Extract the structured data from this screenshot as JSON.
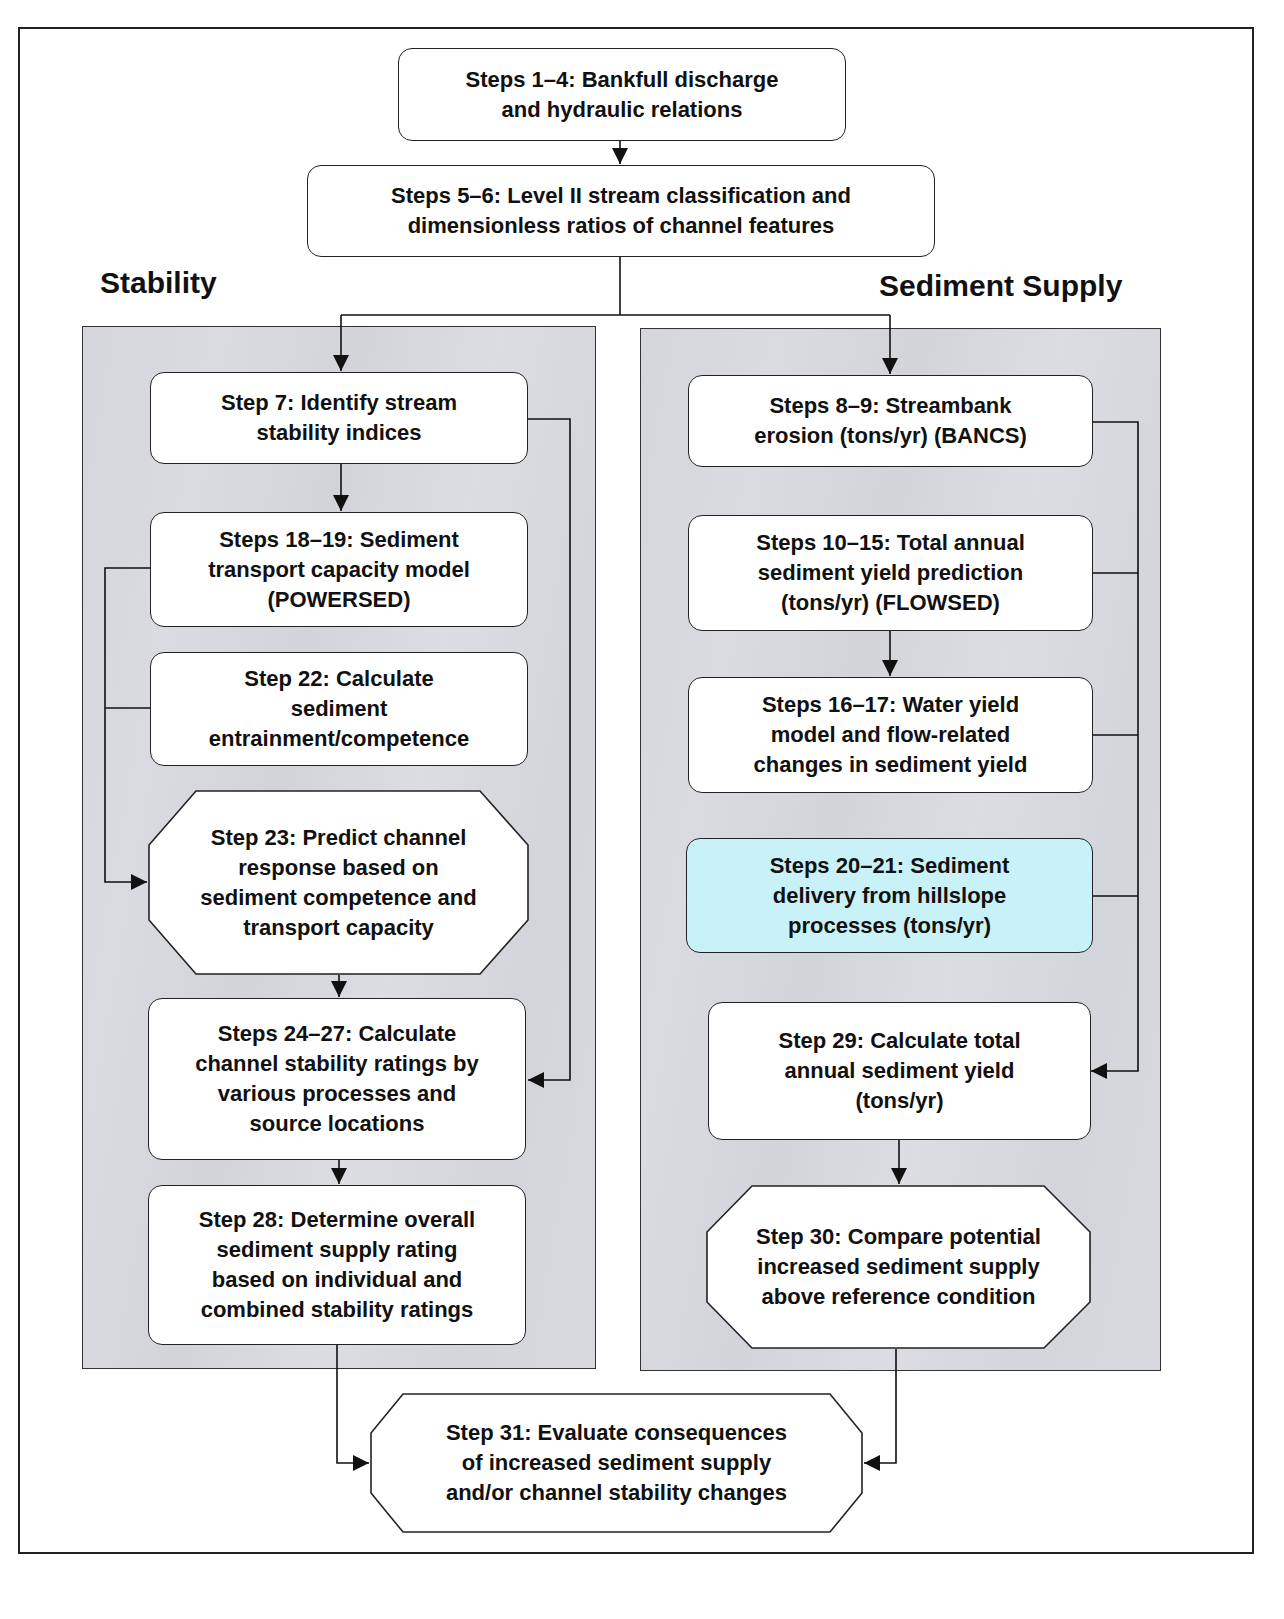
{
  "diagram": {
    "sections": {
      "stability": "Stability",
      "sediment_supply": "Sediment Supply"
    },
    "top_steps": [
      {
        "id": "steps-1-4",
        "label": "Steps 1–4:  Bankfull discharge\nand hydraulic relations"
      },
      {
        "id": "steps-5-6",
        "label": "Steps 5–6:  Level II stream classification and\ndimensionless ratios of channel features"
      }
    ],
    "stability_steps": [
      {
        "id": "step-7",
        "label": "Step 7:  Identify stream\nstability indices",
        "shape": "rounded-rect"
      },
      {
        "id": "steps-18-19",
        "label": "Steps 18–19:  Sediment\ntransport capacity model\n(POWERSED)",
        "shape": "rounded-rect"
      },
      {
        "id": "step-22",
        "label": "Step 22:  Calculate\nsediment\nentrainment/competence",
        "shape": "rounded-rect"
      },
      {
        "id": "step-23",
        "label": "Step 23:  Predict channel\nresponse based on\nsediment competence and\ntransport capacity",
        "shape": "octagon"
      },
      {
        "id": "steps-24-27",
        "label": "Steps 24–27:  Calculate\nchannel stability ratings by\nvarious processes and\nsource locations",
        "shape": "rounded-rect"
      },
      {
        "id": "step-28",
        "label": "Step 28:  Determine overall\nsediment supply rating\nbased on individual and\ncombined stability ratings",
        "shape": "rounded-rect"
      }
    ],
    "sediment_steps": [
      {
        "id": "steps-8-9",
        "label": "Steps 8–9:  Streambank\nerosion (tons/yr) (BANCS)",
        "shape": "rounded-rect"
      },
      {
        "id": "steps-10-15",
        "label": "Steps 10–15:  Total annual\nsediment yield prediction\n(tons/yr) (FLOWSED)",
        "shape": "rounded-rect"
      },
      {
        "id": "steps-16-17",
        "label": "Steps 16–17:  Water yield\nmodel and flow-related\nchanges in sediment yield",
        "shape": "rounded-rect"
      },
      {
        "id": "steps-20-21",
        "label": "Steps 20–21:  Sediment\ndelivery from hillslope\nprocesses (tons/yr)",
        "shape": "rounded-rect",
        "fill": "#c9f2f8"
      },
      {
        "id": "step-29",
        "label": "Step 29:  Calculate total\nannual sediment yield\n(tons/yr)",
        "shape": "rounded-rect"
      },
      {
        "id": "step-30",
        "label": "Step 30:  Compare potential\nincreased sediment supply\nabove reference condition",
        "shape": "octagon"
      }
    ],
    "final_step": {
      "id": "step-31",
      "label": "Step 31:  Evaluate consequences\nof increased sediment supply\nand/or channel stability changes",
      "shape": "octagon"
    },
    "colors": {
      "panel_fill": "#d6d8de",
      "highlight_fill": "#c9f2f8",
      "box_fill": "#ffffff",
      "line": "#1a1a1a"
    }
  }
}
